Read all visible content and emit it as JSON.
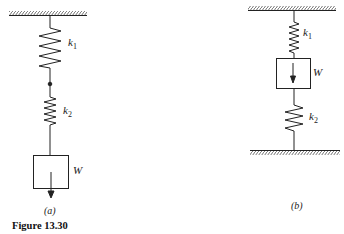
{
  "figure": {
    "caption": "Figure 13.30",
    "panels": [
      {
        "id": "a",
        "label": "(a)",
        "arrangement": "springs in series, mass hanging below",
        "springs": [
          {
            "name": "k",
            "sub": "1"
          },
          {
            "name": "k",
            "sub": "2"
          }
        ],
        "mass": "W"
      },
      {
        "id": "b",
        "label": "(b)",
        "arrangement": "mass between two springs, fixed top and bottom",
        "springs": [
          {
            "name": "k",
            "sub": "1"
          },
          {
            "name": "k",
            "sub": "2"
          }
        ],
        "mass": "W"
      }
    ]
  }
}
